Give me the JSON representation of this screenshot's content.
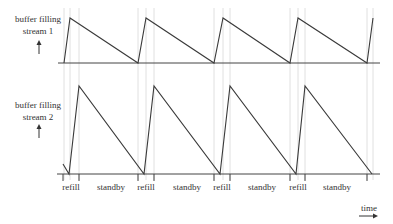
{
  "diagram": {
    "type": "timing-diagram",
    "stream1": {
      "label_line1": "buffer filling",
      "label_line2": "stream 1",
      "baseline_y": 63,
      "points": [
        [
          64,
          63
        ],
        [
          70,
          18
        ],
        [
          138,
          63
        ],
        [
          146,
          18
        ],
        [
          214,
          63
        ],
        [
          223,
          18
        ],
        [
          290,
          63
        ],
        [
          298,
          18
        ],
        [
          367,
          63
        ],
        [
          373,
          18
        ]
      ]
    },
    "stream2": {
      "label_line1": "buffer filling",
      "label_line2": "stream 2",
      "baseline_y": 174,
      "points": [
        [
          63,
          164
        ],
        [
          69,
          174
        ],
        [
          79,
          86
        ],
        [
          144,
          174
        ],
        [
          154,
          86
        ],
        [
          220,
          174
        ],
        [
          230,
          86
        ],
        [
          296,
          174
        ],
        [
          305,
          86
        ],
        [
          372,
          174
        ]
      ]
    },
    "phases": [
      {
        "label": "refill",
        "x": 71
      },
      {
        "label": "standby",
        "x": 111
      },
      {
        "label": "refill",
        "x": 146
      },
      {
        "label": "standby",
        "x": 187
      },
      {
        "label": "refill",
        "x": 222
      },
      {
        "label": "standby",
        "x": 262
      },
      {
        "label": "refill",
        "x": 298
      },
      {
        "label": "standby",
        "x": 337
      }
    ],
    "ticks_x": [
      63,
      79,
      138,
      154,
      214,
      230,
      290,
      305,
      367
    ],
    "guides_x": [
      64,
      70,
      79,
      138,
      146,
      154,
      214,
      223,
      230,
      290,
      298,
      305,
      367,
      373
    ],
    "time_label": "time",
    "colors": {
      "line": "#3a3a3a",
      "guide": "#d8d8d8",
      "text": "#333333"
    }
  }
}
